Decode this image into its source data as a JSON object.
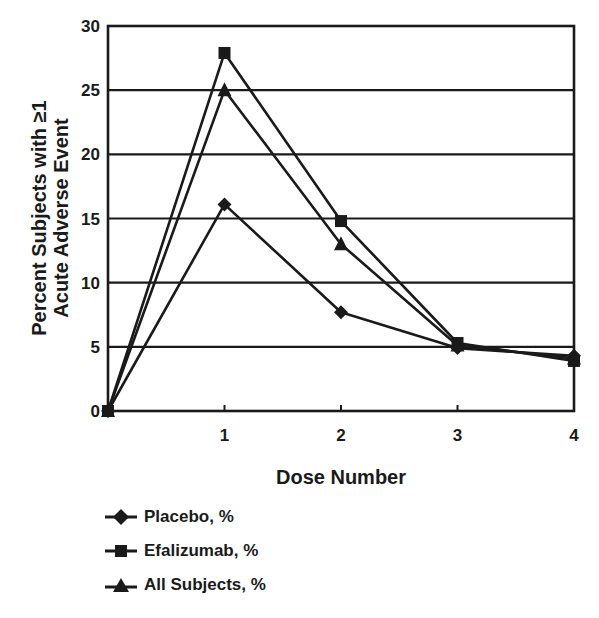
{
  "chart_data": {
    "type": "line",
    "title": "",
    "xlabel": "Dose Number",
    "ylabel_lines": [
      "Percent Subjects with ≥1",
      "Acute Adverse Event"
    ],
    "ylabel": "Percent Subjects with ≥1 Acute Adverse Event",
    "x": [
      0,
      1,
      2,
      3,
      4
    ],
    "x_tick_labels": [
      "1",
      "2",
      "3",
      "4"
    ],
    "x_ticks": [
      1,
      2,
      3,
      4
    ],
    "y_ticks": [
      0,
      5,
      10,
      15,
      20,
      25,
      30
    ],
    "y_tick_labels": [
      "0",
      "5",
      "10",
      "15",
      "20",
      "25",
      "30"
    ],
    "xlim": [
      0,
      4
    ],
    "ylim": [
      0,
      30
    ],
    "grid": "horizontal",
    "legend_position": "below-left",
    "series": [
      {
        "name": "Placebo, %",
        "marker": "diamond",
        "values": [
          0,
          16.1,
          7.7,
          4.9,
          4.3
        ]
      },
      {
        "name": "Efalizumab, %",
        "marker": "square",
        "values": [
          0,
          27.9,
          14.8,
          5.3,
          3.9
        ]
      },
      {
        "name": "All Subjects, %",
        "marker": "triangle",
        "values": [
          0,
          25.0,
          13.0,
          5.1,
          4.1
        ]
      }
    ]
  },
  "legend": {
    "items": [
      {
        "label": "Placebo, %",
        "marker": "diamond"
      },
      {
        "label": "Efalizumab, %",
        "marker": "square"
      },
      {
        "label": "All Subjects, %",
        "marker": "triangle"
      }
    ]
  },
  "colors": {
    "ink": "#1a1a1a",
    "background": "#ffffff"
  }
}
